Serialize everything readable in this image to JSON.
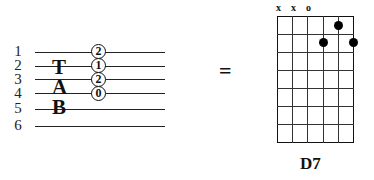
{
  "tab": {
    "string_numbers": [
      "1",
      "2",
      "3",
      "4",
      "5",
      "6"
    ],
    "letters": [
      "T",
      "A",
      "B"
    ],
    "frets": [
      {
        "string": 1,
        "fret": "2"
      },
      {
        "string": 2,
        "fret": "1"
      },
      {
        "string": 3,
        "fret": "2"
      },
      {
        "string": 4,
        "fret": "0"
      }
    ]
  },
  "equals_sign": "=",
  "chord": {
    "name": "D7",
    "open_marks": [
      "x",
      "x",
      "o",
      "",
      "",
      ""
    ],
    "frets_shown": 7,
    "dots": [
      {
        "string_index": 4,
        "fret": 1
      },
      {
        "string_index": 3,
        "fret": 2
      },
      {
        "string_index": 5,
        "fret": 2
      }
    ]
  }
}
